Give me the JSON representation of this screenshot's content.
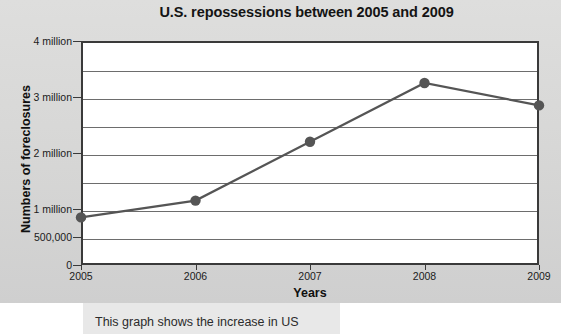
{
  "chart_data": {
    "type": "line",
    "title": "U.S. repossessions between 2005 and 2009",
    "xlabel": "Years",
    "ylabel": "Numbers of foreclosures",
    "categories": [
      "2005",
      "2006",
      "2007",
      "2008",
      "2009"
    ],
    "values": [
      850000,
      1150000,
      2200000,
      3250000,
      2850000
    ],
    "series": [
      {
        "name": "Foreclosures",
        "values": [
          850000,
          1150000,
          2200000,
          3250000,
          2850000
        ]
      }
    ],
    "ylim": [
      0,
      4000000
    ],
    "y_ticks": [
      0,
      500000,
      1000000,
      2000000,
      3000000,
      4000000
    ],
    "y_tick_labels": [
      "0",
      "500,000",
      "1 million",
      "2 million",
      "3 million",
      "4 million"
    ],
    "gridlines": [
      0,
      500000,
      1000000,
      1500000,
      2000000,
      2500000,
      3000000,
      3500000,
      4000000
    ],
    "grid": true,
    "legend": "none",
    "line_color": "#555555",
    "marker_color": "#555555",
    "plot_background": "#ffffff",
    "figure_background": "#d7d7d6",
    "axis_color": "#3a3a3a"
  },
  "caption": {
    "text": "This graph shows the increase in US"
  }
}
